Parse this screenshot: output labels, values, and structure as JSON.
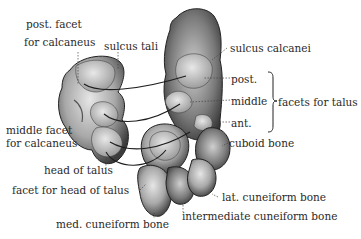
{
  "diagram": {
    "labels": {
      "post_facet_calcaneus_1": "post. facet",
      "post_facet_calcaneus_2": "for calcaneus",
      "sulcus_tali": "sulcus tali",
      "sulcus_calcanei": "sulcus calcanei",
      "post": "post.",
      "middle": "middle",
      "ant": "ant.",
      "facets_for_talus": "facets for talus",
      "middle_facet_1": "middle facet",
      "middle_facet_2": "for calcaneus",
      "cuboid_bone": "cuboid bone",
      "head_of_talus": "head of talus",
      "facet_for_head_of_talus": "facet for head of talus",
      "lat_cuneiform_bone": "lat. cuneiform bone",
      "intermediate_cuneiform_bone": "intermediate cuneiform bone",
      "med_cuneiform_bone": "med. cuneiform bone"
    },
    "colors": {
      "bone_light": "#d9d9d9",
      "bone_mid": "#9a9a9a",
      "bone_dark": "#3a3a3a",
      "text": "#2a2a2a",
      "background": "#ffffff"
    }
  }
}
